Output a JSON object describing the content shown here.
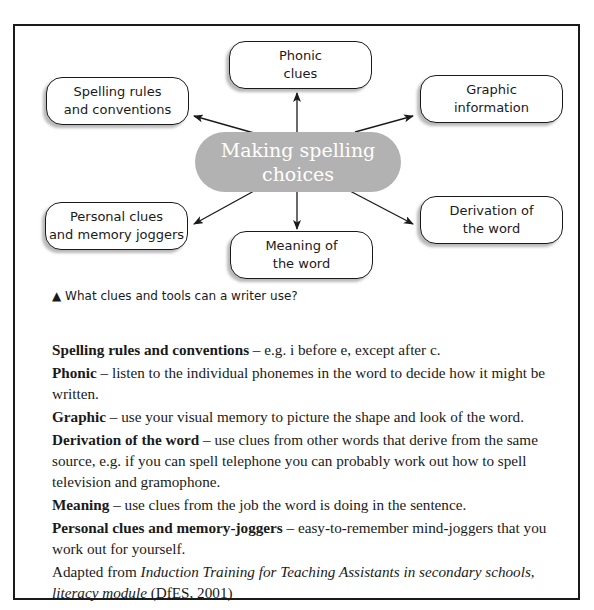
{
  "diagram": {
    "center": {
      "line1": "Making spelling",
      "line2": "choices",
      "fill": "#b2b2b2"
    },
    "nodes": [
      {
        "id": "phonic",
        "line1": "Phonic",
        "line2": "clues"
      },
      {
        "id": "spelling-rules",
        "line1": "Spelling rules",
        "line2": "and conventions"
      },
      {
        "id": "graphic",
        "line1": "Graphic",
        "line2": "information"
      },
      {
        "id": "personal",
        "line1": "Personal clues",
        "line2": "and memory joggers"
      },
      {
        "id": "meaning",
        "line1": "Meaning of",
        "line2": "the word"
      },
      {
        "id": "derivation",
        "line1": "Derivation of",
        "line2": "the word"
      }
    ],
    "caption_icon": "▲",
    "caption": "What clues and tools can a writer use?"
  },
  "definitions": [
    {
      "term": "Spelling rules and conventions",
      "sep": " – ",
      "text": "e.g. i before e, except after c."
    },
    {
      "term": "Phonic",
      "sep": " – ",
      "text": "listen to the individual phonemes in the word to decide how it might be written."
    },
    {
      "term": "Graphic",
      "sep": " – ",
      "text": "use your visual memory to picture the shape and look of the word."
    },
    {
      "term": "Derivation of the word",
      "sep": " – ",
      "text": "use clues from other words that derive from the same source, e.g. if you can spell telephone you can probably work out how to spell television and gramophone."
    },
    {
      "term": "Meaning",
      "sep": " – ",
      "text": "use clues from the job the word is doing in the sentence."
    },
    {
      "term": "Personal clues and memory-joggers",
      "sep": " – ",
      "text": "easy-to-remember mind-joggers that you work out for yourself."
    }
  ],
  "source": {
    "prefix": "Adapted from ",
    "title": "Induction Training for Teaching Assistants in secondary schools, literacy module",
    "suffix": " (DfES, 2001)"
  }
}
